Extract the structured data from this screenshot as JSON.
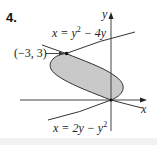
{
  "problem": {
    "number": "4."
  },
  "axes": {
    "x_label": "x",
    "y_label": "y"
  },
  "curves": [
    {
      "name": "upper-curve",
      "equation_lhs": "x = y",
      "equation_sup": "2",
      "equation_rhs": " − 4y",
      "full": "x = y^2 − 4y"
    },
    {
      "name": "lower-curve",
      "equation_lhs": "x = 2y − y",
      "equation_sup": "2",
      "full": "x = 2y − y^2"
    }
  ],
  "points": [
    {
      "label": "(−3, 3)",
      "x": -3,
      "y": 3
    },
    {
      "label": "",
      "x": 0,
      "y": 0
    }
  ],
  "colors": {
    "region_fill": "#c9c9c9",
    "curve": "#333333",
    "axis": "#444444",
    "text": "#222222"
  }
}
